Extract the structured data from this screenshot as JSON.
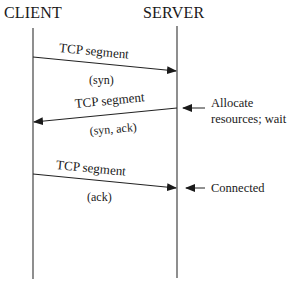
{
  "diagram": {
    "type": "sequence",
    "participants": [
      {
        "id": "client",
        "label": "CLIENT"
      },
      {
        "id": "server",
        "label": "SERVER"
      }
    ],
    "messages": [
      {
        "from": "client",
        "to": "server",
        "label": "TCP segment",
        "sublabel": "(syn)"
      },
      {
        "from": "server",
        "to": "client",
        "label": "TCP segment",
        "sublabel": "(syn, ack)"
      },
      {
        "from": "client",
        "to": "server",
        "label": "TCP segment",
        "sublabel": "(ack)"
      }
    ],
    "annotations": [
      {
        "target": "server",
        "line1": "Allocate",
        "line2": "resources; wait"
      },
      {
        "target": "server",
        "line1": "Connected"
      }
    ]
  }
}
